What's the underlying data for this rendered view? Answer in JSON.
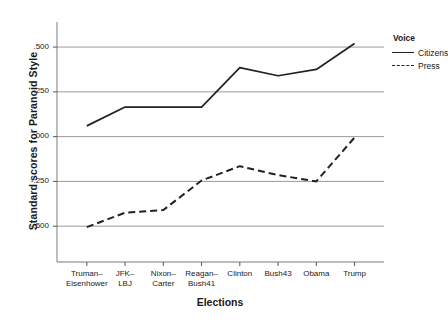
{
  "chart_data": {
    "type": "line",
    "title": "",
    "xlabel": "Elections",
    "ylabel": "Standard scores for Paranoid Style",
    "categories": [
      "Truman–\nEisenhower",
      "JFK–\nLBJ",
      "Nixon–\nCarter",
      "Reagan–\nBush41",
      "Clinton",
      "Bush43",
      "Obama",
      "Trump"
    ],
    "category_lines": [
      [
        "Truman–",
        "Eisenhower"
      ],
      [
        "JFK–",
        "LBJ"
      ],
      [
        "Nixon–",
        "Carter"
      ],
      [
        "Reagan–",
        "Bush41"
      ],
      [
        "Clinton",
        ""
      ],
      [
        "Bush43",
        ""
      ],
      [
        "Obama",
        ""
      ],
      [
        "Trump",
        ""
      ]
    ],
    "ylim": [
      -0.7,
      0.64
    ],
    "yticks": [
      0.5,
      0.25,
      0.0,
      -0.25,
      -0.5
    ],
    "ytick_labels": [
      ".500",
      ".250",
      ".000",
      "-.250",
      "-.500"
    ],
    "grid": "horizontal",
    "legend_position": "right",
    "legend_title": "Voice",
    "series": [
      {
        "name": "Citizens",
        "style": "solid",
        "color": "#222222",
        "values": [
          0.06,
          0.165,
          0.165,
          0.165,
          0.385,
          0.34,
          0.375,
          0.52
        ]
      },
      {
        "name": "Press",
        "style": "dashed",
        "color": "#222222",
        "values": [
          -0.505,
          -0.425,
          -0.41,
          -0.245,
          -0.165,
          -0.215,
          -0.25,
          -0.005
        ]
      }
    ]
  },
  "legend": {
    "title": "Voice",
    "entries": [
      {
        "label": "Citizens",
        "style": "solid"
      },
      {
        "label": "Press",
        "style": "dashed"
      }
    ]
  },
  "axes": {
    "x_title": "Elections",
    "y_title": "Standard scores for Paranoid Style"
  }
}
